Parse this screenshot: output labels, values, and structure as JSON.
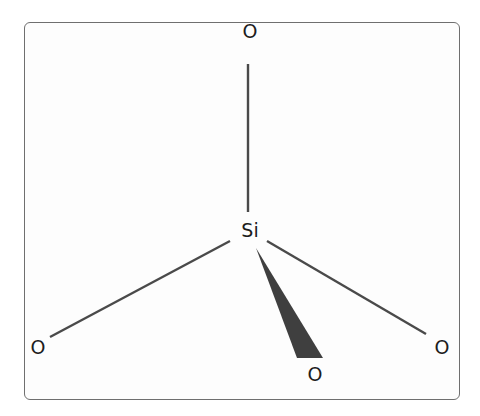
{
  "diagram": {
    "title": "",
    "center_atom": {
      "label": "Si",
      "x": 250,
      "y": 230
    },
    "atoms": [
      {
        "id": "o-top",
        "label": "O",
        "x": 250,
        "y": 31
      },
      {
        "id": "o-left",
        "label": "O",
        "x": 38,
        "y": 347
      },
      {
        "id": "o-right",
        "label": "O",
        "x": 442,
        "y": 347
      },
      {
        "id": "o-bottom",
        "label": "O",
        "x": 315,
        "y": 374
      }
    ],
    "bonds": [
      {
        "to": "o-top",
        "type": "single",
        "x1": 248,
        "y1": 64,
        "x2": 248,
        "y2": 212
      },
      {
        "to": "o-left",
        "type": "single",
        "x1": 230,
        "y1": 241,
        "x2": 50,
        "y2": 337
      },
      {
        "to": "o-right",
        "type": "single",
        "x1": 267,
        "y1": 241,
        "x2": 426,
        "y2": 334
      },
      {
        "to": "o-bottom",
        "type": "wedge",
        "apex": [
          256,
          248
        ],
        "base": [
          [
            297,
            358
          ],
          [
            323,
            358
          ]
        ]
      }
    ],
    "colors": {
      "bond": "#4a4a4a",
      "wedge": "#3f3f3f",
      "frame": "#6f6f6f",
      "text": "#1c1c1c"
    }
  }
}
